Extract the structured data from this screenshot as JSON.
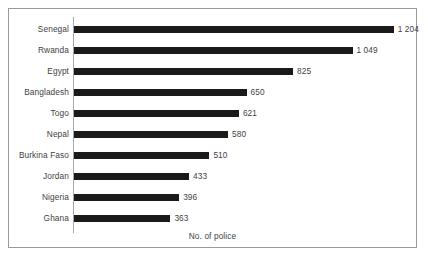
{
  "chart_data": {
    "type": "bar",
    "orientation": "horizontal",
    "title": "",
    "xlabel": "No. of police",
    "ylabel": "",
    "grid": false,
    "legend": false,
    "xlim": [
      0,
      1204
    ],
    "categories": [
      "Senegal",
      "Rwanda",
      "Egypt",
      "Bangladesh",
      "Togo",
      "Nepal",
      "Burkina Faso",
      "Jordan",
      "Nigeria",
      "Ghana"
    ],
    "values": [
      1204,
      1049,
      825,
      650,
      621,
      580,
      510,
      433,
      396,
      363
    ],
    "value_labels": [
      "1 204",
      "1 049",
      "825",
      "650",
      "621",
      "580",
      "510",
      "433",
      "396",
      "363"
    ],
    "bar_color": "#1a1a1a",
    "axis_color": "#a6a6a6",
    "text_color": "#3f3f3f",
    "frame_color": "#9a9a9a",
    "background": "#ffffff"
  }
}
